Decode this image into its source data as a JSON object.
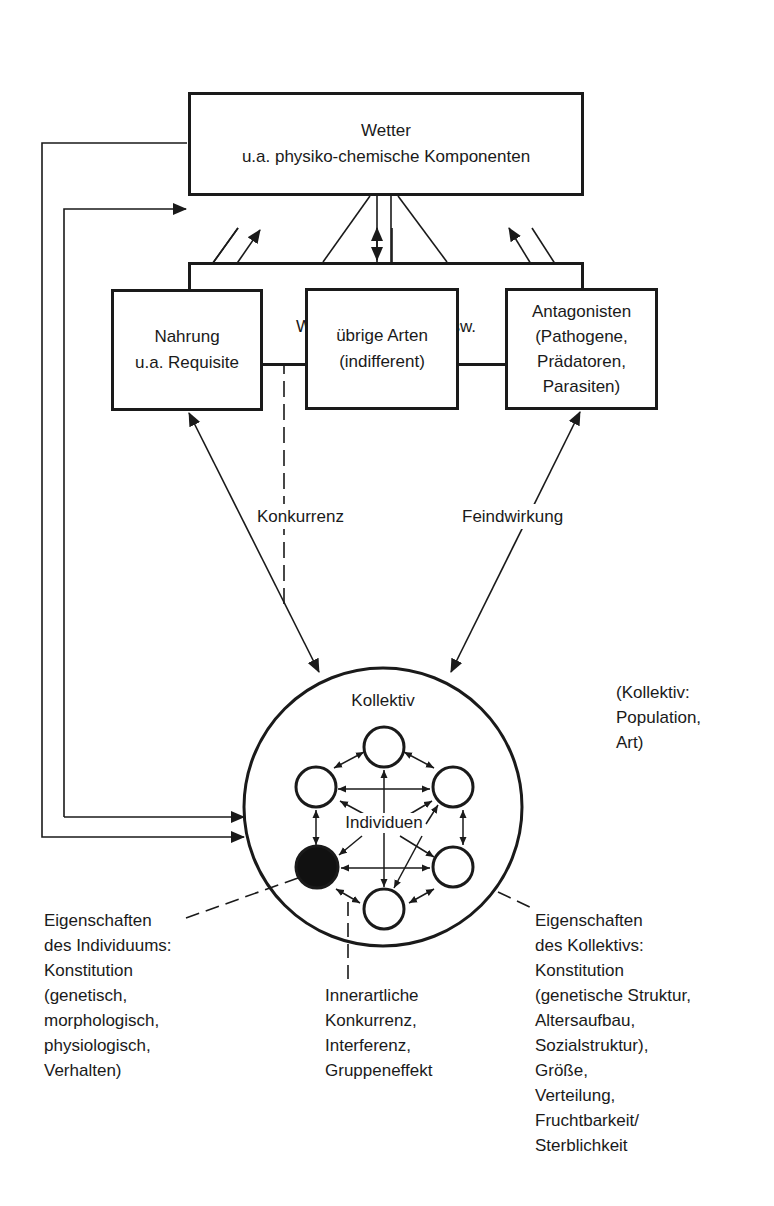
{
  "boxes": {
    "wetter": {
      "line1": "Wetter",
      "line2": "u.a. physiko-chemische Komponenten"
    },
    "habitat": {
      "line1": "Habitat",
      "line2": "Wohnraum, Boden usw."
    },
    "nahrung": {
      "line1": "Nahrung",
      "line2": "u.a. Requisite"
    },
    "uebrige_arten": {
      "line1": "übrige Arten",
      "line2": "(indifferent)"
    },
    "antagonisten": {
      "line1": "Antagonisten",
      "line2": "(Pathogene,",
      "line3": "Prädatoren,",
      "line4": "Parasiten)"
    }
  },
  "edge_labels": {
    "konkurrenz": "Konkurrenz",
    "feindwirkung": "Feindwirkung"
  },
  "kollektiv": {
    "title": "Kollektiv",
    "individuen": "Individuen",
    "note": [
      "(Kollektiv:",
      "Population,",
      "Art)"
    ]
  },
  "annotations": {
    "individuum": [
      "Eigenschaften",
      "des Individuums:",
      "Konstitution",
      "(genetisch,",
      "morphologisch,",
      "physiologisch,",
      "Verhalten)"
    ],
    "innerartlich": [
      "Innerartliche",
      "Konkurrenz,",
      "Interferenz,",
      "Gruppeneffekt"
    ],
    "kollektiv": [
      "Eigenschaften",
      "des Kollektivs:",
      "Konstitution",
      "(genetische Struktur,",
      "Altersaufbau,",
      "Sozialstruktur),",
      "Größe,",
      "Verteilung,",
      "Fruchtbarkeit/",
      "Sterblichkeit"
    ]
  },
  "colors": {
    "ink": "#1a1a1a",
    "background": "#ffffff"
  }
}
